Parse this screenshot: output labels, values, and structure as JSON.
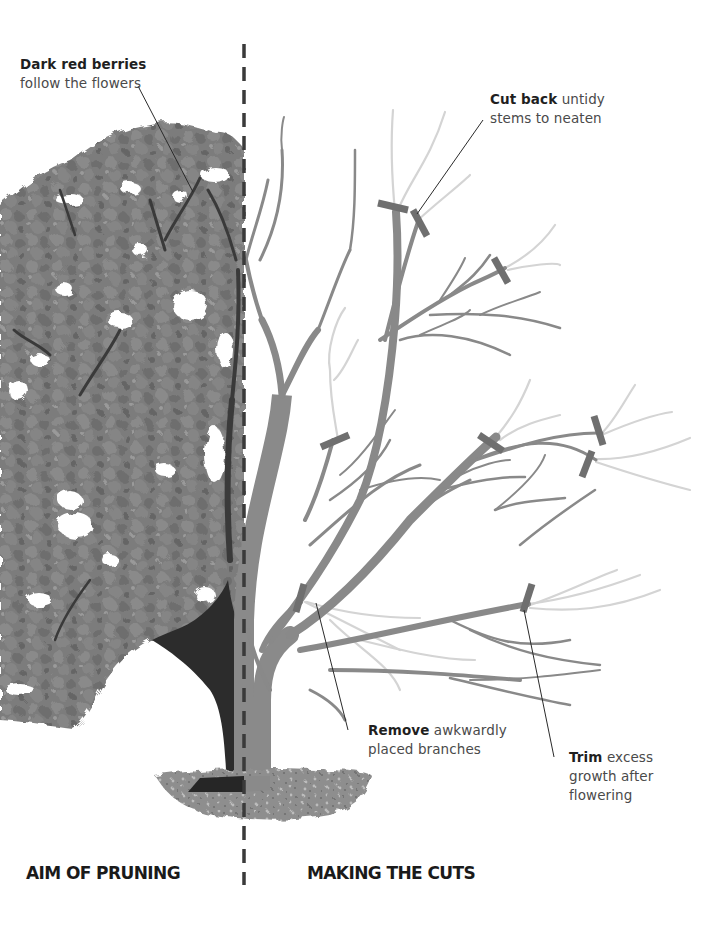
{
  "figure": {
    "left_panel_title": "AIM OF PRUNING",
    "right_panel_title": "MAKING THE CUTS"
  },
  "callouts": {
    "berries": {
      "bold": "Dark red berries",
      "text": "follow the flowers"
    },
    "cut_back": {
      "bold": "Cut back",
      "text_line1": "untidy",
      "text_line2": "stems to neaten"
    },
    "remove": {
      "bold": "Remove",
      "text_line1": "awkwardly",
      "text_line2": "placed branches"
    },
    "trim": {
      "bold": "Trim",
      "text_line1": "excess",
      "text_line2": "growth after",
      "text_line3": "flowering"
    }
  },
  "colors": {
    "foliage": "#7d7d7d",
    "foliage_dark": "#5e5e5e",
    "trunk_dark": "#2b2b2b",
    "branch": "#8a8a8a",
    "branch_removed": "#d2d2d2",
    "cut_mark": "#707070",
    "divider": "#3a3a3a",
    "ground": "#8c8c8c"
  }
}
